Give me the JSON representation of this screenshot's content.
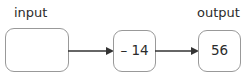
{
  "diagram": {
    "type": "function-machine-flow",
    "stroke_color": "#999999",
    "text_color": "#2b2b2b",
    "arrow_color": "#333333",
    "background": "#ffffff",
    "nodes": [
      {
        "id": "input",
        "label": "input",
        "value": "",
        "shape": "rounded-rectangle"
      },
      {
        "id": "operation",
        "label": "",
        "value": "– 14",
        "shape": "rounded-rectangle"
      },
      {
        "id": "output",
        "label": "output",
        "value": "56",
        "shape": "rounded-rectangle"
      }
    ],
    "arrows": [
      {
        "id": "arrow-1",
        "from": "input",
        "to": "operation",
        "style": "solid-filled-head"
      },
      {
        "id": "arrow-2",
        "from": "operation",
        "to": "output",
        "style": "solid-filled-head"
      }
    ]
  }
}
